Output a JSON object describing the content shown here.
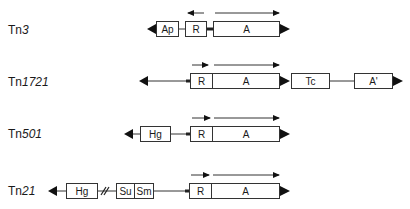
{
  "colors": {
    "line": "#333333",
    "fill": "#ffffff",
    "arrowhead": "#111111"
  },
  "rows": [
    {
      "name_prefix": "Tn",
      "name_number": "3",
      "genes": [
        "Ap",
        "R",
        "A"
      ],
      "transcription_arrows": [
        "R: leftward",
        "A: rightward"
      ]
    },
    {
      "name_prefix": "Tn",
      "name_number": "1721",
      "genes": [
        "R",
        "A",
        "Tc",
        "A'"
      ],
      "transcription_arrows": [
        "R: rightward",
        "A: rightward"
      ]
    },
    {
      "name_prefix": "Tn",
      "name_number": "501",
      "genes": [
        "Hg",
        "R",
        "A"
      ],
      "transcription_arrows": [
        "R: rightward",
        "A: rightward"
      ]
    },
    {
      "name_prefix": "Tn",
      "name_number": "21",
      "genes": [
        "Hg",
        "Su",
        "Sm",
        "R",
        "A"
      ],
      "break_marker": "//",
      "transcription_arrows": [
        "R: rightward",
        "A: rightward"
      ]
    }
  ]
}
